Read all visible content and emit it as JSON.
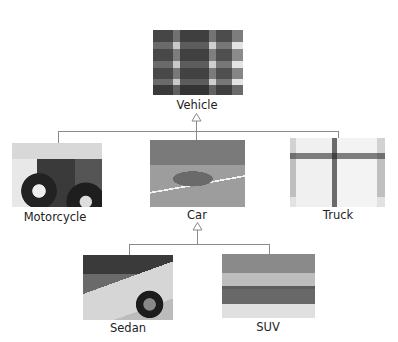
{
  "diagram": {
    "type": "class-hierarchy",
    "root": {
      "label": "Vehicle",
      "image": "traffic-jam-photo"
    },
    "level1": [
      {
        "label": "Motorcycle",
        "image": "motorcycle-photo"
      },
      {
        "label": "Car",
        "image": "car-photo"
      },
      {
        "label": "Truck",
        "image": "dump-trucks-photo"
      }
    ],
    "level2": [
      {
        "parent": "Car",
        "label": "Sedan",
        "image": "sedans-row-photo"
      },
      {
        "parent": "Car",
        "label": "SUV",
        "image": "suvs-desert-photo"
      }
    ],
    "edges": [
      {
        "from": "Motorcycle",
        "to": "Vehicle",
        "arrow": "hollow-triangle"
      },
      {
        "from": "Car",
        "to": "Vehicle",
        "arrow": "hollow-triangle"
      },
      {
        "from": "Truck",
        "to": "Vehicle",
        "arrow": "hollow-triangle"
      },
      {
        "from": "Sedan",
        "to": "Car",
        "arrow": "hollow-triangle"
      },
      {
        "from": "SUV",
        "to": "Car",
        "arrow": "hollow-triangle"
      }
    ],
    "colors": {
      "connector": "#8a8a8a",
      "text": "#222222",
      "background": "#ffffff"
    }
  }
}
